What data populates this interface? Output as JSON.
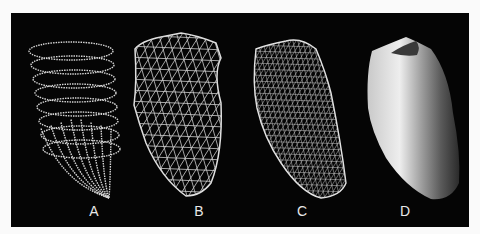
{
  "figure": {
    "background_color": "#050505",
    "page_color": "#fafafa",
    "line_color": "#d8d8d8",
    "panels": [
      {
        "label": "A",
        "description": "point-cloud contour rings of ventricle"
      },
      {
        "label": "B",
        "description": "coarse wireframe mesh"
      },
      {
        "label": "C",
        "description": "fine wireframe mesh"
      },
      {
        "label": "D",
        "description": "shaded solid surface"
      }
    ]
  }
}
